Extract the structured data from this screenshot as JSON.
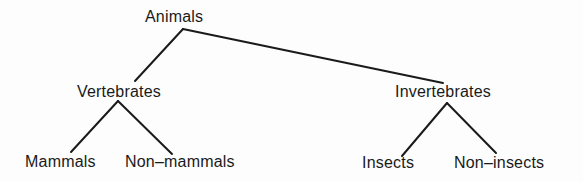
{
  "tree": {
    "root": {
      "label": "Animals"
    },
    "level1": [
      {
        "label": "Vertebrates"
      },
      {
        "label": "Invertebrates"
      }
    ],
    "level2": [
      {
        "label": "Mammals",
        "parent": "Vertebrates"
      },
      {
        "label": "Non–mammals",
        "parent": "Vertebrates"
      },
      {
        "label": "Insects",
        "parent": "Invertebrates"
      },
      {
        "label": "Non–insects",
        "parent": "Invertebrates"
      }
    ]
  },
  "style": {
    "line_color": "#1a1a1a",
    "background": "#fdfdfd"
  }
}
